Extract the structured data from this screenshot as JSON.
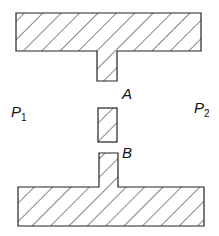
{
  "diagram": {
    "type": "cross-section schematic",
    "stroke_color": "#222222",
    "hatch_color": "#222222",
    "background": "#ffffff",
    "labels": {
      "gap_a": "A",
      "gap_b": "B",
      "p1_letter": "P",
      "p1_sub": "1",
      "p2_letter": "P",
      "p2_sub": "2"
    },
    "shapes": [
      {
        "id": "top-bar",
        "x": 16,
        "y": 13,
        "w": 185,
        "h": 38
      },
      {
        "id": "top-stem",
        "x": 97,
        "y": 51,
        "w": 20,
        "h": 30
      },
      {
        "id": "middle-block",
        "x": 98,
        "y": 108,
        "w": 19,
        "h": 34
      },
      {
        "id": "bottom-stem",
        "x": 99,
        "y": 153,
        "w": 19,
        "h": 34
      },
      {
        "id": "bottom-bar",
        "x": 18,
        "y": 187,
        "w": 186,
        "h": 39
      }
    ]
  }
}
